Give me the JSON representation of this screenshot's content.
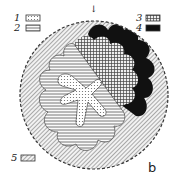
{
  "figure": {
    "panel_label": "b",
    "arrow_marker": "↓",
    "legend": [
      {
        "number": "1",
        "pattern": "dotted-stipple",
        "description": "dotted/stippled zone (central branching core)"
      },
      {
        "number": "2",
        "pattern": "horizontal-lines",
        "description": "horizontally hatched zone (lobed inner region)"
      },
      {
        "number": "3",
        "pattern": "cross-hatch-grid",
        "description": "cross-hatched sector"
      },
      {
        "number": "4",
        "pattern": "solid-black",
        "description": "solid dark marginal lobes"
      },
      {
        "number": "5",
        "pattern": "diagonal-fine-hatch",
        "description": "outer diagonal-hatched ring"
      }
    ],
    "outline": "dashed circular boundary"
  }
}
